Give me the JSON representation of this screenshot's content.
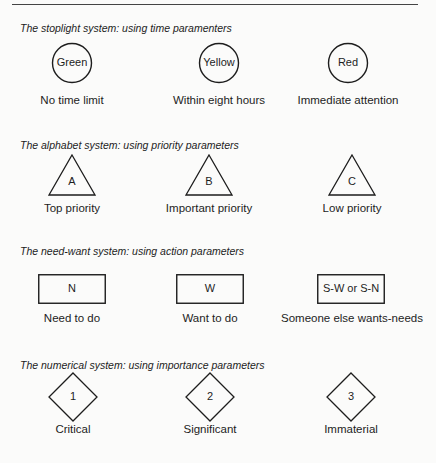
{
  "sections": [
    {
      "title": "The stoplight system: using time paramenters",
      "shape": "circle",
      "items": [
        {
          "symbol": "Green",
          "caption": "No time limit"
        },
        {
          "symbol": "Yellow",
          "caption": "Within eight hours"
        },
        {
          "symbol": "Red",
          "caption": "Immediate attention"
        }
      ]
    },
    {
      "title": "The alphabet system: using priority parameters",
      "shape": "triangle",
      "items": [
        {
          "symbol": "A",
          "caption": "Top priority"
        },
        {
          "symbol": "B",
          "caption": "Important priority"
        },
        {
          "symbol": "C",
          "caption": "Low priority"
        }
      ]
    },
    {
      "title": "The need-want system: using action parameters",
      "shape": "rectangle",
      "items": [
        {
          "symbol": "N",
          "caption": "Need to do"
        },
        {
          "symbol": "W",
          "caption": "Want to do"
        },
        {
          "symbol": "S-W or S-N",
          "caption": "Someone else wants-needs"
        }
      ]
    },
    {
      "title": "The numerical system: using importance parameters",
      "shape": "diamond",
      "items": [
        {
          "symbol": "1",
          "caption": "Critical"
        },
        {
          "symbol": "2",
          "caption": "Significant"
        },
        {
          "symbol": "3",
          "caption": "Immaterial"
        }
      ]
    }
  ]
}
